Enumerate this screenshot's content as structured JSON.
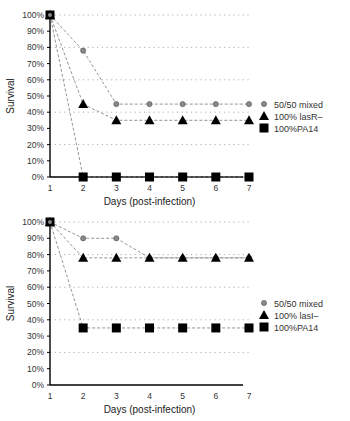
{
  "chart_data": [
    {
      "type": "line",
      "title": "",
      "xlabel": "Days (post-infection)",
      "ylabel": "Survival",
      "x": [
        1,
        2,
        3,
        4,
        5,
        6,
        7
      ],
      "xlim": [
        1,
        7
      ],
      "ylim": [
        0,
        100
      ],
      "yticks": [
        "0%",
        "10%",
        "20%",
        "30%",
        "40%",
        "50%",
        "60%",
        "70%",
        "80%",
        "90%",
        "100%"
      ],
      "xticks": [
        "1",
        "2",
        "3",
        "4",
        "5",
        "6",
        "7"
      ],
      "grid": "horizontal dotted every 20%",
      "legend_position": "right",
      "series": [
        {
          "name": "50/50 mixed",
          "marker": "circle",
          "values": [
            100,
            78,
            45,
            45,
            45,
            45,
            45
          ]
        },
        {
          "name": "100% lasR–",
          "marker": "triangle",
          "values": [
            100,
            45,
            35,
            35,
            35,
            35,
            35
          ]
        },
        {
          "name": "100%PA14",
          "marker": "square",
          "values": [
            100,
            0,
            0,
            0,
            0,
            0,
            0
          ]
        }
      ]
    },
    {
      "type": "line",
      "title": "",
      "xlabel": "Days (post-infection)",
      "ylabel": "Survival",
      "x": [
        1,
        2,
        3,
        4,
        5,
        6,
        7
      ],
      "xlim": [
        1,
        7
      ],
      "ylim": [
        0,
        100
      ],
      "yticks": [
        "0%",
        "10%",
        "20%",
        "30%",
        "40%",
        "50%",
        "60%",
        "70%",
        "80%",
        "90%",
        "100%"
      ],
      "xticks": [
        "1",
        "2",
        "3",
        "4",
        "5",
        "6",
        "7"
      ],
      "grid": "horizontal dotted every 20%",
      "legend_position": "right",
      "series": [
        {
          "name": "50/50 mixed",
          "marker": "circle",
          "values": [
            100,
            90,
            90,
            78,
            78,
            78,
            78
          ]
        },
        {
          "name": "100% lasI–",
          "marker": "triangle",
          "values": [
            100,
            78,
            78,
            78,
            78,
            78,
            78
          ]
        },
        {
          "name": "100%PA14",
          "marker": "square",
          "values": [
            100,
            35,
            35,
            35,
            35,
            35,
            35
          ]
        }
      ]
    }
  ]
}
